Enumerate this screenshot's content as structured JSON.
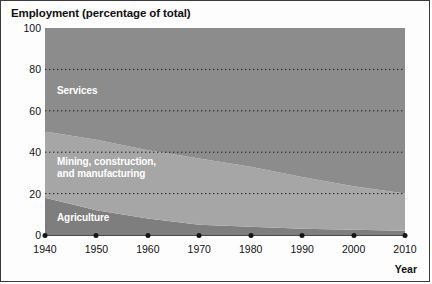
{
  "chart_data": {
    "type": "area",
    "stacked": true,
    "title": "Employment (percentage of total)",
    "xlabel": "Year",
    "ylabel": "",
    "xlim": [
      1940,
      2010
    ],
    "ylim": [
      0,
      100
    ],
    "grid": true,
    "grid_style": "dotted horizontal",
    "legend_position": "in-plot labels",
    "x": [
      1940,
      1950,
      1960,
      1970,
      1980,
      1990,
      2000,
      2010
    ],
    "xticklabels": [
      "1940",
      "1950",
      "1960",
      "1970",
      "1980",
      "1990",
      "2000",
      "2010"
    ],
    "yticks": [
      0,
      20,
      40,
      60,
      80,
      100
    ],
    "yticklabels": [
      "0",
      "20",
      "40",
      "60",
      "80",
      "100"
    ],
    "series": [
      {
        "name": "Agriculture",
        "color": "#7e7e7e",
        "values": [
          18,
          12,
          8,
          5,
          4,
          3,
          2.5,
          2
        ]
      },
      {
        "name": "Mining, construction,\nand manufacturing",
        "label_line1": "Mining, construction,",
        "label_line2": "and manufacturing",
        "color": "#a6a6a6",
        "values": [
          32,
          34,
          33,
          32,
          29,
          25,
          21,
          18
        ]
      },
      {
        "name": "Services",
        "color": "#8c8c8c",
        "values": [
          50,
          54,
          59,
          63,
          67,
          72,
          76.5,
          80
        ]
      }
    ]
  },
  "chart": {
    "title": "Employment (percentage of total)",
    "xaxis_label": "Year"
  }
}
